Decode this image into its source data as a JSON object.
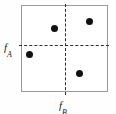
{
  "figure": {
    "type": "scatter-quadrant-diagram",
    "width": 116,
    "height": 114,
    "background_color": "#fefefe"
  },
  "plot": {
    "frame": {
      "x": 21,
      "y": 5,
      "width": 87,
      "height": 87,
      "border_color": "#9a9a9a",
      "fill_color": "#ffffff"
    },
    "dividers": [
      {
        "name": "vertical-threshold",
        "orientation": "vertical",
        "position_px": 65,
        "style": "dashed",
        "color": "#2b2b2b",
        "label_ref": "f_B"
      },
      {
        "name": "horizontal-threshold",
        "orientation": "horizontal",
        "position_px": 45,
        "style": "dashed",
        "color": "#2b2b2b",
        "label_ref": "f_A"
      }
    ]
  },
  "labels": {
    "left_axis": {
      "main": "f",
      "subscript": "A",
      "full": "fA"
    },
    "bottom_axis": {
      "main": "f",
      "subscript": "B",
      "full": "fB"
    }
  },
  "chart_data": {
    "type": "scatter",
    "title": "",
    "xlabel": "f_B",
    "ylabel": "f_A",
    "grid": false,
    "legend": null,
    "xlim": [
      0,
      1
    ],
    "ylim": [
      0,
      1
    ],
    "threshold_x": 0.506,
    "threshold_y": 0.54,
    "marker_color": "#111111",
    "marker_size_px": 7,
    "points": [
      {
        "id": "p1",
        "x_px": 54,
        "y_px": 28,
        "x": 0.379,
        "y": 0.736,
        "quadrant": "upper-left"
      },
      {
        "id": "p2",
        "x_px": 89,
        "y_px": 21,
        "x": 0.782,
        "y": 0.816,
        "quadrant": "upper-right"
      },
      {
        "id": "p3",
        "x_px": 29,
        "y_px": 54,
        "x": 0.092,
        "y": 0.437,
        "quadrant": "lower-left"
      },
      {
        "id": "p4",
        "x_px": 79,
        "y_px": 73,
        "x": 0.667,
        "y": 0.218,
        "quadrant": "lower-right"
      }
    ]
  }
}
